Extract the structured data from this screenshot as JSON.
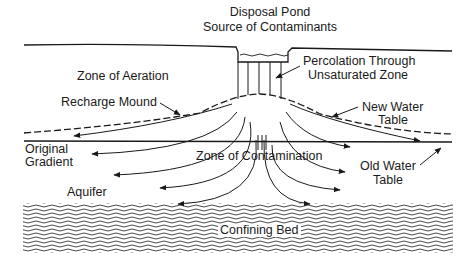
{
  "diagram": {
    "title_line1": "Disposal Pond",
    "title_line2": "Source of Contaminants",
    "labels": {
      "percolation_line1": "Percolation Through",
      "percolation_line2": "Unsaturated Zone",
      "zone_of_aeration": "Zone of Aeration",
      "recharge_mound": "Recharge Mound",
      "new_water_table_line1": "New Water",
      "new_water_table_line2": "Table",
      "original_gradient_line1": "Original",
      "original_gradient_line2": "Gradient",
      "zone_of_contamination": "Zone of Contamination",
      "old_water_table_line1": "Old Water",
      "old_water_table_line2": "Table",
      "aquifer": "Aquifer",
      "confining_bed": "Confining Bed"
    },
    "colors": {
      "ink": "#1a1a1a",
      "background": "#ffffff"
    }
  }
}
